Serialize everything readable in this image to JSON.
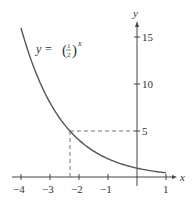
{
  "chart_data": {
    "type": "line",
    "title": "",
    "function_label": {
      "lhs": "y = ",
      "base_num": "1",
      "base_den": "2",
      "exponent": "x"
    },
    "xlabel": "x",
    "ylabel": "y",
    "xlim": [
      -4,
      1
    ],
    "ylim": [
      0,
      16
    ],
    "x_ticks": [
      -4,
      -3,
      -2,
      -1,
      1
    ],
    "x_tick_labels": [
      "−4",
      "−3",
      "−2",
      "−1",
      "1"
    ],
    "y_ticks": [
      5,
      10,
      15
    ],
    "y_tick_labels": [
      "5",
      "10",
      "15"
    ],
    "grid": false,
    "series": [
      {
        "name": "y = (1/2)^x",
        "x": [
          -4,
          -3,
          -2.32,
          -2,
          -1,
          0,
          1
        ],
        "y": [
          16,
          8,
          5,
          4,
          2,
          1,
          0.5
        ],
        "color": "#555555"
      }
    ],
    "annotations": [
      {
        "type": "dashed-guide",
        "x": -2.32,
        "y": 5,
        "note": "dashed lines from curve point to x-axis and y-axis at y = 5"
      }
    ]
  }
}
